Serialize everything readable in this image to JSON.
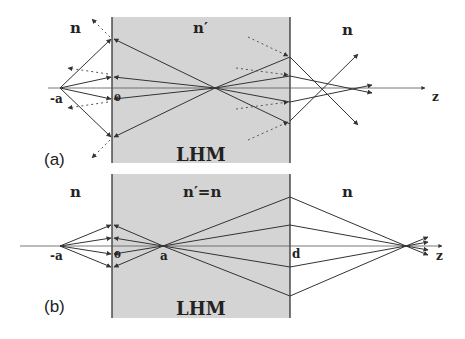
{
  "colors": {
    "slab_fill": "#d4d4d4",
    "line": "#333333",
    "axis": "#555555",
    "dotted": "#555555"
  },
  "panel_a": {
    "tag": "(a)",
    "left_medium": "n",
    "slab_medium": "n′",
    "right_medium": "n",
    "slab_label": "LHM",
    "source_label": "-a",
    "origin_label": "0",
    "axis_label": "z"
  },
  "panel_b": {
    "tag": "(b)",
    "left_medium": "n",
    "slab_medium": "n′=n",
    "right_medium": "n",
    "slab_label": "LHM",
    "source_label": "-a",
    "origin_label": "0",
    "focus_label": "a",
    "exit_label": "d",
    "axis_label": "z"
  }
}
